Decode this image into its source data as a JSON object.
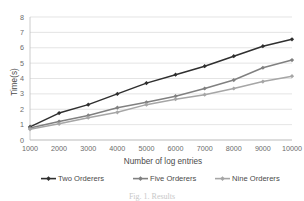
{
  "chart_data": {
    "type": "line",
    "title": "",
    "xlabel": "Number of log entries",
    "ylabel": "Time(s)",
    "x": [
      1000,
      2000,
      3000,
      4000,
      5000,
      6000,
      7000,
      8000,
      9000,
      10000
    ],
    "xticklabels": [
      "1000",
      "2000",
      "3000",
      "4000",
      "5000",
      "6000",
      "7000",
      "8000",
      "9000",
      "10000"
    ],
    "yticklabels": [
      "0",
      "1",
      "2",
      "3",
      "4",
      "5",
      "6",
      "7",
      "8"
    ],
    "yticks": [
      0,
      1,
      2,
      3,
      4,
      5,
      6,
      7,
      8
    ],
    "ylim": [
      0,
      8
    ],
    "xlim": [
      1000,
      10000
    ],
    "grid": "horizontal",
    "legend_position": "bottom",
    "series": [
      {
        "name": "Two Orderers",
        "color": "#2f2f2f",
        "marker": "diamond",
        "values": [
          0.85,
          1.75,
          2.3,
          3.0,
          3.7,
          4.25,
          4.8,
          5.45,
          6.1,
          6.55
        ]
      },
      {
        "name": "Five Orderers",
        "color": "#808080",
        "marker": "diamond",
        "values": [
          0.78,
          1.2,
          1.6,
          2.1,
          2.45,
          2.85,
          3.35,
          3.9,
          4.7,
          5.2
        ]
      },
      {
        "name": "Nine Orderers",
        "color": "#a6a6a6",
        "marker": "diamond",
        "values": [
          0.7,
          1.05,
          1.45,
          1.8,
          2.3,
          2.65,
          2.95,
          3.35,
          3.8,
          4.15
        ]
      }
    ]
  },
  "caption": {
    "text": "Fig. 1. Results"
  },
  "colors": {
    "grid": "#d9d9d9",
    "axis": "#bfbfbf",
    "text": "#4a4a4a",
    "background": "#ffffff"
  }
}
